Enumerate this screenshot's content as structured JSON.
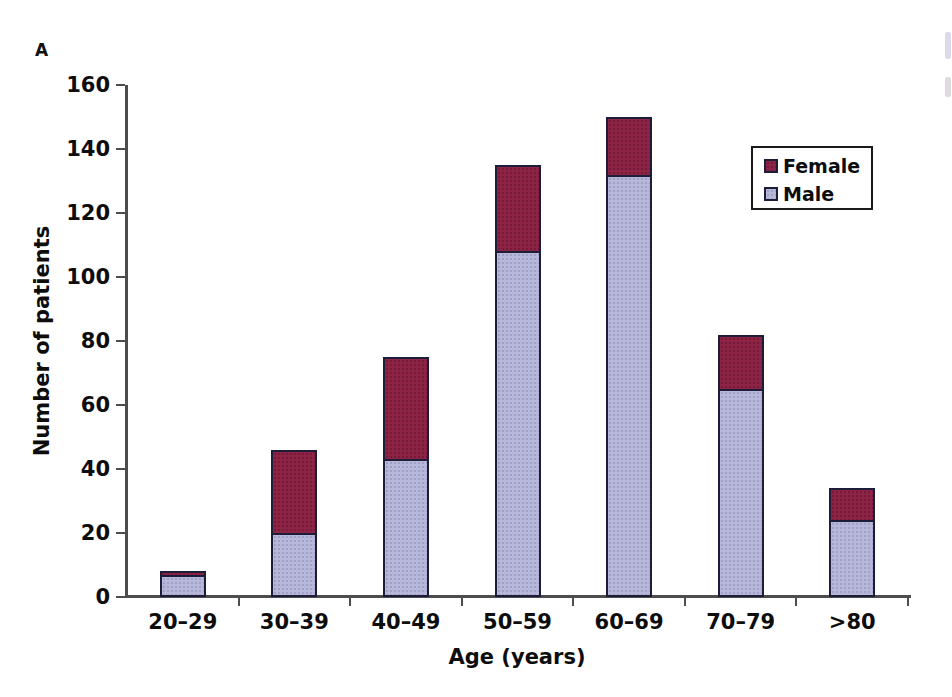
{
  "panel_label": "A",
  "chart_data": {
    "type": "bar",
    "stacked": true,
    "title": "",
    "xlabel": "Age (years)",
    "ylabel": "Number of patients",
    "categories": [
      "20–29",
      "30–39",
      "40–49",
      "50–59",
      "60–69",
      "70–79",
      ">80"
    ],
    "series": [
      {
        "name": "Male",
        "color": "#b7b8d9",
        "values": [
          7,
          20,
          43,
          108,
          132,
          65,
          24
        ]
      },
      {
        "name": "Female",
        "color": "#8d2345",
        "values": [
          1,
          26,
          32,
          27,
          18,
          17,
          10
        ]
      }
    ],
    "totals": [
      8,
      46,
      75,
      135,
      150,
      82,
      34
    ],
    "ylim": [
      0,
      160
    ],
    "ytick_step": 20,
    "yticks": [
      "0",
      "20",
      "40",
      "60",
      "80",
      "100",
      "120",
      "140",
      "160"
    ],
    "grid": false,
    "legend": {
      "position": "upper-right",
      "entries": [
        "Female",
        "Male"
      ]
    }
  },
  "colors": {
    "male_fill": "#b7b8d9",
    "female_fill": "#8d2345",
    "bar_border": "#1d1d3a",
    "axis_line": "#4d4d4d",
    "text": "#0d0d0d",
    "background": "#ffffff"
  }
}
